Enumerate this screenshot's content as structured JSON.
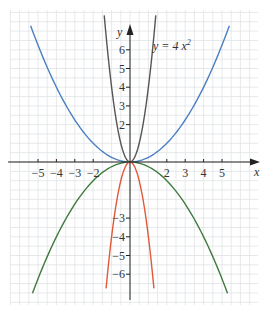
{
  "chart_data": {
    "type": "line",
    "title": "",
    "annotation": "y = 4 x²",
    "xlabel": "x",
    "ylabel": "y",
    "xlim": [
      -6.5,
      7.3
    ],
    "ylim": [
      -7.8,
      8.6
    ],
    "x_ticks": [
      -5,
      -4,
      -3,
      -2,
      2,
      3,
      4,
      5
    ],
    "y_ticks": [
      -6,
      -5,
      -4,
      -3,
      2,
      3,
      4,
      5,
      6
    ],
    "x_tick_labels": [
      "−5",
      "−4",
      "−3",
      "−2",
      "2",
      "3",
      "4",
      "5"
    ],
    "y_tick_labels": [
      "−6",
      "−5",
      "−4",
      "−3",
      "2",
      "3",
      "4",
      "5",
      "6"
    ],
    "grid": true,
    "grid_minor": true,
    "series": [
      {
        "name": "y = 4x²",
        "coef": 4,
        "color": "#555555",
        "x_range": [
          -1.4,
          1.4
        ]
      },
      {
        "name": "y = x²/4",
        "coef": 0.25,
        "color": "#4a7fc1",
        "x_range": [
          -5.4,
          5.4
        ]
      },
      {
        "name": "y = −x²/4",
        "coef": -0.25,
        "color": "#3f7a3f",
        "x_range": [
          -5.3,
          5.3
        ]
      },
      {
        "name": "y = −4x²",
        "coef": -4,
        "color": "#e05a3a",
        "x_range": [
          -1.3,
          1.3
        ]
      }
    ]
  },
  "labels": {
    "x_axis": "x",
    "y_axis": "y",
    "annotation_prefix": "y = 4 x",
    "annotation_sup": "2"
  }
}
